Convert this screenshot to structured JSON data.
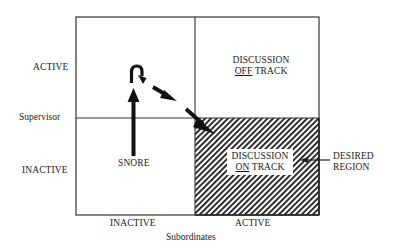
{
  "diagram": {
    "y_axis": {
      "title": "Supervisor",
      "ticks": [
        "ACTIVE",
        "INACTIVE"
      ]
    },
    "x_axis": {
      "title": "Subordinates",
      "ticks": [
        "INACTIVE",
        "ACTIVE"
      ]
    },
    "quadrants": {
      "top_left": {
        "label": ""
      },
      "top_right": {
        "line1": "DISCUSSION",
        "line2_underlined": "OFF",
        "line2_rest": " TRACK"
      },
      "bottom_left": {
        "label": "SNORE"
      },
      "bottom_right": {
        "line1": "DISCUSSION",
        "line2_underlined": "ON",
        "line2_rest": " TRACK",
        "hatched": true
      }
    },
    "callout": {
      "line1": "DESIRED",
      "line2": "REGION"
    },
    "path_arrows": [
      "up arrow in Snore quadrant toward Supervisor Active",
      "hook arrow turning right",
      "dashed diagonal arrows toward Discussion On Track"
    ],
    "colors": {
      "line": "#333333",
      "hatch": "#1a1a1a",
      "background": "#ffffff"
    }
  }
}
